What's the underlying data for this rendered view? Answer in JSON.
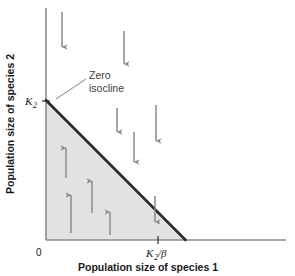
{
  "figure": {
    "kind": "zero-isocline-competition-plot",
    "axes": {
      "x_title": "Population size of species 1",
      "y_title": "Population size of species 2",
      "origin_label": "0",
      "x_tick_label": "K",
      "x_tick_sub": "2",
      "x_tick_suffix": "/β",
      "y_tick_label": "K",
      "y_tick_sub": "2"
    },
    "annotation": {
      "line1": "Zero",
      "line2": "isocline"
    },
    "colors": {
      "axis": "#8c8c8c",
      "isocline": "#2b2b2b",
      "region_fill": "#e2e2e2",
      "arrow": "#8a8a8a",
      "text": "#1a1a1a",
      "annotation_text": "#3b3b3b",
      "background": "#ffffff"
    }
  },
  "chart_data": {
    "type": "line",
    "title": "",
    "subtitle": "",
    "xlabel": "Population size of species 1",
    "ylabel": "Population size of species 2",
    "xlim": [
      0,
      1.72
    ],
    "ylim": [
      0,
      1.66
    ],
    "grid": false,
    "legend_position": "none",
    "xticks": [
      {
        "value": 0,
        "label": "0"
      },
      {
        "value": 1.0,
        "label": "K2/β"
      }
    ],
    "yticks": [
      {
        "value": 1.0,
        "label": "K2"
      }
    ],
    "series": [
      {
        "name": "Zero isocline of species 2",
        "type": "line",
        "x": [
          0,
          1.0
        ],
        "y": [
          1.0,
          0
        ],
        "color": "#2b2b2b",
        "width": 2.6
      }
    ],
    "regions": [
      {
        "name": "growth region (below isocline)",
        "fill": "#e2e2e2",
        "vertices": [
          [
            0,
            0
          ],
          [
            0,
            1.0
          ],
          [
            1.0,
            0
          ]
        ]
      }
    ],
    "annotations": [
      {
        "text": "Zero isocline",
        "x": 0.38,
        "y": 1.31,
        "leader_to": [
          0.045,
          1.02
        ]
      }
    ],
    "vector_field": {
      "description": "Arrows show direction of change in species 2 population size; up inside the shaded region (below the isocline), down outside it.",
      "arrows": [
        {
          "x": 0.115,
          "y_tail": 1.62,
          "y_head": 1.28,
          "direction": "down"
        },
        {
          "x": 0.7,
          "y_tail": 1.49,
          "y_head": 1.15,
          "direction": "down"
        },
        {
          "x": 0.63,
          "y_tail": 1.0,
          "y_head": 0.76,
          "direction": "down"
        },
        {
          "x": 0.885,
          "y_tail": 0.83,
          "y_head": 0.52,
          "direction": "down"
        },
        {
          "x": 1.21,
          "y_tail": 1.06,
          "y_head": 0.69,
          "direction": "down"
        },
        {
          "x": 1.185,
          "y_tail": 0.41,
          "y_head": 0.14,
          "direction": "down"
        },
        {
          "x": 0.175,
          "y_tail": 0.62,
          "y_head": 0.93,
          "direction": "up"
        },
        {
          "x": 0.25,
          "y_tail": 0.06,
          "y_head": 0.46,
          "direction": "up"
        },
        {
          "x": 0.485,
          "y_tail": 0.28,
          "y_head": 0.6,
          "direction": "up"
        },
        {
          "x": 0.66,
          "y_tail": 0.05,
          "y_head": 0.27,
          "direction": "up"
        }
      ]
    }
  }
}
